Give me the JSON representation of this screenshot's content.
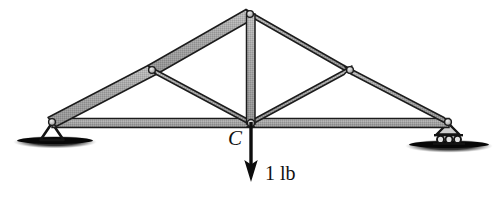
{
  "figure": {
    "type": "statics-truss-diagram",
    "background_color": "#ffffff",
    "member_fill": "#9a9a9a",
    "member_stroke": "#1c1c1c",
    "joint_fill": "#c8c8c8",
    "ground_color": "#111111",
    "text_color": "#111111"
  },
  "labels": {
    "joint_C": "C",
    "load": "1 lb"
  },
  "load": {
    "magnitude": 1,
    "units": "lb",
    "text": "1 lb",
    "direction": "down",
    "applied_at_joint": "C",
    "arrow_from": [
      251,
      123
    ],
    "arrow_to": [
      251,
      181
    ]
  },
  "supports": [
    {
      "name": "pin-support",
      "side": "left",
      "at": [
        52,
        122
      ],
      "symbol": "triangle-on-ground"
    },
    {
      "name": "roller-support",
      "side": "right",
      "at": [
        448,
        122
      ],
      "symbol": "triangle-on-rollers",
      "roller_count": 3
    }
  ],
  "joints": [
    {
      "name": "left-support-joint",
      "x": 52,
      "y": 122
    },
    {
      "name": "left-top-joint",
      "x": 152,
      "y": 70
    },
    {
      "name": "apex-joint",
      "x": 250,
      "y": 14
    },
    {
      "name": "right-top-joint",
      "x": 350,
      "y": 70
    },
    {
      "name": "right-support-joint",
      "x": 448,
      "y": 122
    },
    {
      "name": "center-joint-C",
      "x": 251,
      "y": 123
    }
  ],
  "members": [
    {
      "name": "bottom-chord-left",
      "from": "left-support-joint",
      "to": "center-joint-C",
      "width": 9
    },
    {
      "name": "bottom-chord-right",
      "from": "center-joint-C",
      "to": "right-support-joint",
      "width": 9
    },
    {
      "name": "top-chord-left-lower",
      "from": "left-support-joint",
      "to": "left-top-joint",
      "width": 9
    },
    {
      "name": "top-chord-left-upper",
      "from": "left-top-joint",
      "to": "apex-joint",
      "width": 9
    },
    {
      "name": "top-chord-right-upper",
      "from": "apex-joint",
      "to": "right-top-joint",
      "width": 9
    },
    {
      "name": "top-chord-right-lower",
      "from": "right-top-joint",
      "to": "right-support-joint",
      "width": 9
    },
    {
      "name": "web-diagonal-left",
      "from": "left-top-joint",
      "to": "center-joint-C",
      "width": 8
    },
    {
      "name": "web-vertical-center",
      "from": "apex-joint",
      "to": "center-joint-C",
      "width": 8
    },
    {
      "name": "web-diagonal-right",
      "from": "right-top-joint",
      "to": "center-joint-C",
      "width": 8
    }
  ]
}
